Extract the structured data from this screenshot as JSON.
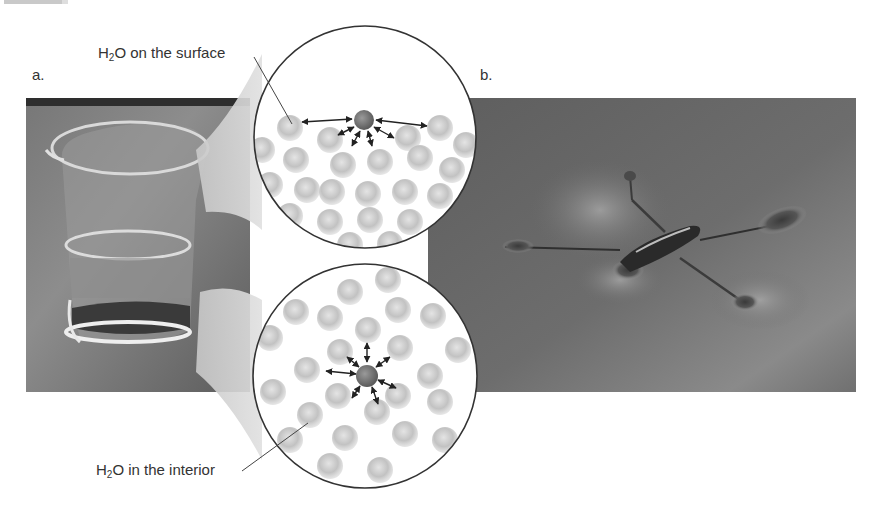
{
  "figure": {
    "panels": [
      {
        "id": "a",
        "label": "a.",
        "subject": "beaker of water"
      },
      {
        "id": "b",
        "label": "b.",
        "subject": "water strider standing on water surface"
      }
    ],
    "callouts": {
      "surface": {
        "prefix": "H",
        "subscript": "2",
        "suffix": "O on the surface"
      },
      "interior": {
        "prefix": "H",
        "subscript": "2",
        "suffix": "O in the interior"
      }
    },
    "magnifier_circles": [
      {
        "id": "surface-view",
        "depicts": "surface water molecule attracted sideways and downward only"
      },
      {
        "id": "interior-view",
        "depicts": "interior water molecule attracted in all directions"
      }
    ],
    "colors": {
      "background": "#ffffff",
      "photo_dark": "#4a4a4a",
      "photo_mid": "#6e6e6e",
      "molecule": "#b9b9b9",
      "highlight_molecule": "#6f6f6f",
      "zoom_funnel": "#d8d8d8",
      "outline": "#333333"
    }
  }
}
